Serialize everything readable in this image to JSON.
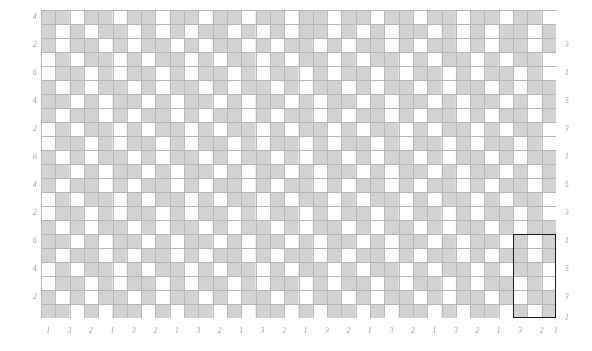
{
  "figure": {
    "width": 592,
    "height": 351,
    "background": "#ffffff",
    "type": "checkerboard-grid-diagram"
  },
  "plot": {
    "left": 41,
    "top": 10,
    "width": 515,
    "height": 308,
    "cols": 36,
    "rows": 22,
    "cell_width": 14.31,
    "cell_height": 14.0,
    "gridline_color": "#b4b4b4",
    "gridline_width": 0.9,
    "cell_fill_on": "#d2d2d2",
    "cell_fill_off": "#ffffff"
  },
  "highlight": {
    "label": "selected-region",
    "color": "#1a1a1a",
    "col_start": 33,
    "col_span": 3,
    "row_start": 16,
    "row_span": 6
  },
  "axes": {
    "left_ticks": [
      {
        "label": "4",
        "row": 0.5
      },
      {
        "label": "2",
        "row": 2.5
      },
      {
        "label": "6",
        "row": 4.5
      },
      {
        "label": "4",
        "row": 6.5
      },
      {
        "label": "2",
        "row": 8.5
      },
      {
        "label": "6",
        "row": 10.5
      },
      {
        "label": "4",
        "row": 12.5
      },
      {
        "label": "2",
        "row": 14.5
      },
      {
        "label": "6",
        "row": 16.5
      },
      {
        "label": "4",
        "row": 18.5
      },
      {
        "label": "2",
        "row": 20.5
      }
    ],
    "right_ticks": [
      {
        "label": "3",
        "row": 2.5
      },
      {
        "label": "1",
        "row": 4.5
      },
      {
        "label": "5",
        "row": 6.5
      },
      {
        "label": "3",
        "row": 8.5
      },
      {
        "label": "1",
        "row": 10.5
      },
      {
        "label": "5",
        "row": 12.5
      },
      {
        "label": "3",
        "row": 14.5
      },
      {
        "label": "1",
        "row": 16.5
      },
      {
        "label": "5",
        "row": 18.5
      },
      {
        "label": "3",
        "row": 20.5
      },
      {
        "label": "1",
        "row": 22.0
      }
    ],
    "bottom_ticks": [
      {
        "label": "1",
        "col": 0.5
      },
      {
        "label": "3",
        "col": 2.0
      },
      {
        "label": "2",
        "col": 3.5
      },
      {
        "label": "1",
        "col": 5.0
      },
      {
        "label": "3",
        "col": 6.5
      },
      {
        "label": "2",
        "col": 8.0
      },
      {
        "label": "1",
        "col": 9.5
      },
      {
        "label": "3",
        "col": 11.0
      },
      {
        "label": "2",
        "col": 12.5
      },
      {
        "label": "1",
        "col": 14.0
      },
      {
        "label": "3",
        "col": 15.5
      },
      {
        "label": "2",
        "col": 17.0
      },
      {
        "label": "1",
        "col": 18.5
      },
      {
        "label": "3",
        "col": 20.0
      },
      {
        "label": "2",
        "col": 21.5
      },
      {
        "label": "1",
        "col": 23.0
      },
      {
        "label": "3",
        "col": 24.5
      },
      {
        "label": "2",
        "col": 26.0
      },
      {
        "label": "1",
        "col": 27.5
      },
      {
        "label": "3",
        "col": 29.0
      },
      {
        "label": "2",
        "col": 30.5
      },
      {
        "label": "1",
        "col": 32.0
      },
      {
        "label": "3",
        "col": 33.5
      },
      {
        "label": "2",
        "col": 35.0
      },
      {
        "label": "1",
        "col": 36.0
      }
    ]
  },
  "chart_data": {
    "type": "heatmap",
    "title": "",
    "xlabel": "",
    "ylabel": "",
    "grid": true,
    "legend": "none",
    "nrows": 22,
    "ncols": 36,
    "value_map": {
      "0": "#ffffff",
      "1": "#d2d2d2"
    },
    "matrix": [
      [
        1,
        1,
        0,
        1,
        1,
        0,
        1,
        1,
        0,
        1,
        1,
        0,
        1,
        1,
        0,
        1,
        1,
        0,
        1,
        1,
        0,
        1,
        1,
        0,
        1,
        1,
        0,
        1,
        1,
        0,
        1,
        1,
        0,
        1,
        1,
        0
      ],
      [
        1,
        0,
        1,
        0,
        1,
        1,
        0,
        1,
        0,
        1,
        0,
        1,
        1,
        0,
        1,
        0,
        1,
        0,
        1,
        1,
        0,
        1,
        0,
        1,
        0,
        1,
        1,
        0,
        1,
        0,
        1,
        0,
        1,
        1,
        0,
        1
      ],
      [
        1,
        0,
        1,
        1,
        0,
        1,
        0,
        1,
        1,
        0,
        1,
        0,
        1,
        1,
        0,
        1,
        0,
        1,
        1,
        0,
        1,
        0,
        1,
        1,
        0,
        1,
        0,
        1,
        1,
        0,
        1,
        0,
        1,
        1,
        0,
        1
      ],
      [
        0,
        1,
        0,
        1,
        1,
        0,
        1,
        0,
        1,
        1,
        0,
        1,
        0,
        1,
        1,
        0,
        1,
        0,
        1,
        1,
        0,
        1,
        0,
        1,
        1,
        0,
        1,
        0,
        1,
        1,
        0,
        1,
        0,
        1,
        1,
        0
      ],
      [
        0,
        1,
        1,
        0,
        1,
        0,
        1,
        1,
        0,
        1,
        0,
        1,
        1,
        0,
        1,
        0,
        1,
        1,
        0,
        1,
        0,
        1,
        1,
        0,
        1,
        0,
        1,
        1,
        0,
        1,
        0,
        1,
        1,
        0,
        1,
        0
      ],
      [
        1,
        0,
        1,
        0,
        1,
        1,
        0,
        1,
        0,
        1,
        1,
        0,
        1,
        0,
        1,
        1,
        0,
        1,
        0,
        1,
        1,
        0,
        1,
        0,
        1,
        1,
        0,
        1,
        0,
        1,
        1,
        0,
        1,
        0,
        1,
        1
      ],
      [
        1,
        1,
        0,
        1,
        0,
        1,
        1,
        0,
        1,
        0,
        1,
        1,
        0,
        1,
        0,
        1,
        1,
        0,
        1,
        0,
        1,
        1,
        0,
        1,
        0,
        1,
        1,
        0,
        1,
        0,
        1,
        1,
        0,
        1,
        0,
        1
      ],
      [
        1,
        0,
        1,
        1,
        0,
        1,
        0,
        1,
        1,
        0,
        1,
        0,
        1,
        1,
        0,
        1,
        0,
        1,
        1,
        0,
        1,
        0,
        1,
        1,
        0,
        1,
        0,
        1,
        1,
        0,
        1,
        0,
        1,
        1,
        0,
        1
      ],
      [
        0,
        1,
        0,
        1,
        1,
        0,
        1,
        0,
        1,
        1,
        0,
        1,
        0,
        1,
        1,
        0,
        1,
        0,
        1,
        1,
        0,
        1,
        0,
        1,
        1,
        0,
        1,
        0,
        1,
        1,
        0,
        1,
        0,
        1,
        1,
        0
      ],
      [
        0,
        1,
        1,
        0,
        1,
        0,
        1,
        1,
        0,
        1,
        0,
        1,
        1,
        0,
        1,
        0,
        1,
        1,
        0,
        1,
        0,
        1,
        1,
        0,
        1,
        0,
        1,
        1,
        0,
        1,
        0,
        1,
        1,
        0,
        1,
        0
      ],
      [
        1,
        0,
        1,
        0,
        1,
        1,
        0,
        1,
        0,
        1,
        1,
        0,
        1,
        0,
        1,
        1,
        0,
        1,
        0,
        1,
        1,
        0,
        1,
        0,
        1,
        1,
        0,
        1,
        0,
        1,
        1,
        0,
        1,
        0,
        1,
        1
      ],
      [
        1,
        1,
        0,
        1,
        0,
        1,
        1,
        0,
        1,
        0,
        1,
        1,
        0,
        1,
        0,
        1,
        1,
        0,
        1,
        0,
        1,
        1,
        0,
        1,
        0,
        1,
        1,
        0,
        1,
        0,
        1,
        1,
        0,
        1,
        0,
        1
      ],
      [
        1,
        0,
        1,
        1,
        0,
        1,
        0,
        1,
        1,
        0,
        1,
        0,
        1,
        1,
        0,
        1,
        0,
        1,
        1,
        0,
        1,
        0,
        1,
        1,
        0,
        1,
        0,
        1,
        1,
        0,
        1,
        0,
        1,
        1,
        0,
        1
      ],
      [
        0,
        1,
        0,
        1,
        1,
        0,
        1,
        0,
        1,
        1,
        0,
        1,
        0,
        1,
        1,
        0,
        1,
        0,
        1,
        1,
        0,
        1,
        0,
        1,
        1,
        0,
        1,
        0,
        1,
        1,
        0,
        1,
        0,
        1,
        1,
        0
      ],
      [
        0,
        1,
        1,
        0,
        1,
        0,
        1,
        1,
        0,
        1,
        0,
        1,
        1,
        0,
        1,
        0,
        1,
        1,
        0,
        1,
        0,
        1,
        1,
        0,
        1,
        0,
        1,
        1,
        0,
        1,
        0,
        1,
        1,
        0,
        1,
        0
      ],
      [
        1,
        0,
        1,
        0,
        1,
        1,
        0,
        1,
        0,
        1,
        1,
        0,
        1,
        0,
        1,
        1,
        0,
        1,
        0,
        1,
        1,
        0,
        1,
        0,
        1,
        1,
        0,
        1,
        0,
        1,
        1,
        0,
        1,
        0,
        1,
        1
      ],
      [
        1,
        1,
        0,
        1,
        0,
        1,
        1,
        0,
        1,
        0,
        1,
        1,
        0,
        1,
        0,
        1,
        1,
        0,
        1,
        0,
        1,
        1,
        0,
        1,
        0,
        1,
        1,
        0,
        1,
        0,
        1,
        1,
        0,
        1,
        0,
        1
      ],
      [
        1,
        0,
        1,
        1,
        0,
        1,
        0,
        1,
        1,
        0,
        1,
        0,
        1,
        1,
        0,
        1,
        0,
        1,
        1,
        0,
        1,
        0,
        1,
        1,
        0,
        1,
        0,
        1,
        1,
        0,
        1,
        0,
        1,
        1,
        0,
        1
      ],
      [
        0,
        1,
        0,
        1,
        1,
        0,
        1,
        0,
        1,
        1,
        0,
        1,
        0,
        1,
        1,
        0,
        1,
        0,
        1,
        1,
        0,
        1,
        0,
        1,
        1,
        0,
        1,
        0,
        1,
        1,
        0,
        1,
        0,
        1,
        1,
        0
      ],
      [
        0,
        1,
        1,
        0,
        1,
        0,
        1,
        1,
        0,
        1,
        0,
        1,
        1,
        0,
        1,
        0,
        1,
        1,
        0,
        1,
        0,
        1,
        1,
        0,
        1,
        0,
        1,
        1,
        0,
        1,
        0,
        1,
        1,
        0,
        1,
        0
      ],
      [
        1,
        0,
        1,
        0,
        1,
        1,
        0,
        1,
        0,
        1,
        1,
        0,
        1,
        0,
        1,
        1,
        0,
        1,
        0,
        1,
        1,
        0,
        1,
        0,
        1,
        1,
        0,
        1,
        0,
        1,
        1,
        0,
        1,
        0,
        1,
        1
      ],
      [
        1,
        1,
        0,
        1,
        0,
        1,
        1,
        0,
        1,
        0,
        1,
        1,
        0,
        1,
        0,
        1,
        1,
        0,
        1,
        0,
        1,
        1,
        0,
        1,
        0,
        1,
        1,
        0,
        1,
        0,
        1,
        1,
        0,
        1,
        0,
        1
      ]
    ]
  }
}
